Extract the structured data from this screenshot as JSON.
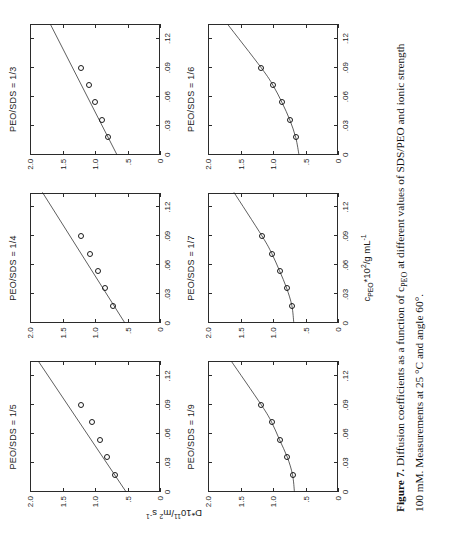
{
  "figure": {
    "caption_lead": "Figure 7.",
    "caption_body": " Diffusion coefficients as a function of c",
    "caption_sub1": "PEO",
    "caption_body2": " at different values of SDS/PEO and ionic strength 100 mM. Measurements at 25 °C and angle 60°."
  },
  "axes": {
    "ylabel_main": "D*10",
    "ylabel_sup": "11",
    "ylabel_unit": "/m",
    "ylabel_unit_sup": "2",
    "ylabel_unit_tail": " s",
    "ylabel_unit_sup2": "-1",
    "xlabel_main": "c",
    "xlabel_sub": "PEO",
    "xlabel_mid": "*10",
    "xlabel_sup": "2",
    "xlabel_tail": "/g mL",
    "xlabel_sup2": "-1",
    "xticks": [
      "0",
      ".03",
      ".06",
      ".09",
      ".12"
    ],
    "yticks": [
      "0",
      ".5",
      "1.0",
      "1.5",
      "2.0"
    ],
    "xlim": [
      0,
      0.135
    ],
    "ylim": [
      0,
      2.0
    ]
  },
  "chart_data": {
    "type": "scatter",
    "title": "Diffusion coefficients as a function of cPEO at different values of SDS/PEO and ionic strength 100 mM. Measurements at 25 °C and angle 60°.",
    "xlabel": "c_PEO*10^2 / g mL^-1",
    "ylabel": "D*10^11 / m^2 s^-1",
    "xlim": [
      0,
      0.135
    ],
    "ylim": [
      0,
      2.0
    ],
    "xticks": [
      0,
      0.03,
      0.06,
      0.09,
      0.12
    ],
    "yticks": [
      0,
      0.5,
      1.0,
      1.5,
      2.0
    ],
    "grid": false,
    "legend": "none",
    "marker": "open-circle",
    "panels": [
      {
        "id": "panel-1-5",
        "label": "PEO/SDS = 1/5",
        "row": 0,
        "col": 0,
        "fit": "linear",
        "fit_intercept": 0.52,
        "fit_slope": 10.0,
        "x": [
          0.018,
          0.036,
          0.054,
          0.072,
          0.09
        ],
        "y": [
          0.7,
          0.82,
          0.92,
          1.05,
          1.22
        ]
      },
      {
        "id": "panel-1-4",
        "label": "PEO/SDS = 1/4",
        "row": 0,
        "col": 1,
        "fit": "linear",
        "fit_intercept": 0.54,
        "fit_slope": 9.4,
        "x": [
          0.018,
          0.036,
          0.054,
          0.072,
          0.09
        ],
        "y": [
          0.72,
          0.84,
          0.95,
          1.08,
          1.22
        ]
      },
      {
        "id": "panel-1-3",
        "label": "PEO/SDS = 1/3",
        "row": 0,
        "col": 2,
        "fit": "linear",
        "fit_intercept": 0.66,
        "fit_slope": 7.6,
        "x": [
          0.018,
          0.036,
          0.054,
          0.072,
          0.09
        ],
        "y": [
          0.8,
          0.9,
          1.0,
          1.1,
          1.22
        ]
      },
      {
        "id": "panel-1-9",
        "label": "PEO/SDS = 1/9",
        "row": 1,
        "col": 0,
        "fit": "curve",
        "fit_intercept": 0.67,
        "x": [
          0.018,
          0.036,
          0.054,
          0.072,
          0.09
        ],
        "y": [
          0.7,
          0.78,
          0.9,
          1.02,
          1.18
        ]
      },
      {
        "id": "panel-1-7",
        "label": "PEO/SDS = 1/7",
        "row": 1,
        "col": 1,
        "fit": "curve",
        "fit_intercept": 0.68,
        "x": [
          0.018,
          0.036,
          0.054,
          0.072,
          0.09
        ],
        "y": [
          0.71,
          0.79,
          0.9,
          1.02,
          1.17
        ]
      },
      {
        "id": "panel-1-6",
        "label": "PEO/SDS = 1/6",
        "row": 1,
        "col": 2,
        "fit": "curve",
        "fit_intercept": 0.6,
        "x": [
          0.018,
          0.036,
          0.054,
          0.072,
          0.09
        ],
        "y": [
          0.65,
          0.74,
          0.86,
          1.0,
          1.18
        ]
      }
    ]
  }
}
